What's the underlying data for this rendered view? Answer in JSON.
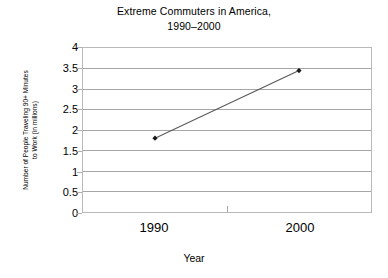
{
  "chart_data": {
    "type": "line",
    "title": "Extreme Commuters in America,",
    "subtitle": "1990–2000",
    "xlabel": "Year",
    "ylabel_line1": "Number of People Traveling 90+ Minutes",
    "ylabel_line2": "to Work (in millions)",
    "categories": [
      "1990",
      "2000"
    ],
    "values": [
      1.8,
      3.45
    ],
    "series": [
      {
        "name": "People traveling 90+ minutes to work",
        "values": [
          1.8,
          3.45
        ]
      }
    ],
    "ylim": [
      0,
      4
    ],
    "ytick_step": 0.5,
    "yticks": [
      "4",
      "3.5",
      "3",
      "2.5",
      "2",
      "1.5",
      "1",
      "0.5",
      "0"
    ],
    "ytick_values": [
      4,
      3.5,
      3,
      2.5,
      2,
      1.5,
      1,
      0.5,
      0
    ],
    "grid": "horizontal",
    "legend": "none",
    "marker": "diamond",
    "colors": {
      "line": "#595959",
      "marker": "#1a1a1a",
      "gridline": "#a6a6a6",
      "frame": "#b9b9b9",
      "text": "#000000",
      "background": "#ffffff"
    }
  }
}
